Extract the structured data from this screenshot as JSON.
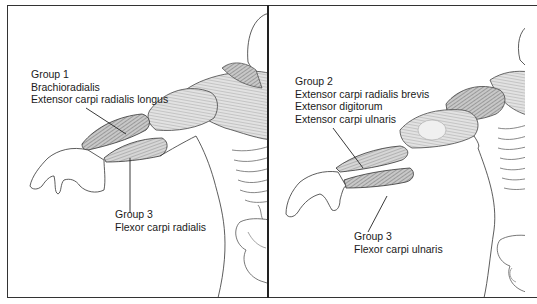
{
  "panels": [
    {
      "id": "left",
      "labels": [
        {
          "id": "group1",
          "lines": [
            "Group 1",
            "Brachioradialis",
            "Extensor carpi radialis longus"
          ]
        },
        {
          "id": "group3",
          "lines": [
            "Group 3",
            "Flexor carpi radialis"
          ]
        }
      ]
    },
    {
      "id": "right",
      "labels": [
        {
          "id": "group2",
          "lines": [
            "Group 2",
            "Extensor carpi radialis brevis",
            "Extensor digitorum",
            "Extensor carpi ulnaris"
          ]
        },
        {
          "id": "group3",
          "lines": [
            "Group 3",
            "Flexor carpi ulnaris"
          ]
        }
      ]
    }
  ],
  "colors": {
    "line": "#222222",
    "muscle_fill": "#bdbdbd",
    "muscle_dark": "#8a8a8a",
    "background": "#ffffff"
  }
}
